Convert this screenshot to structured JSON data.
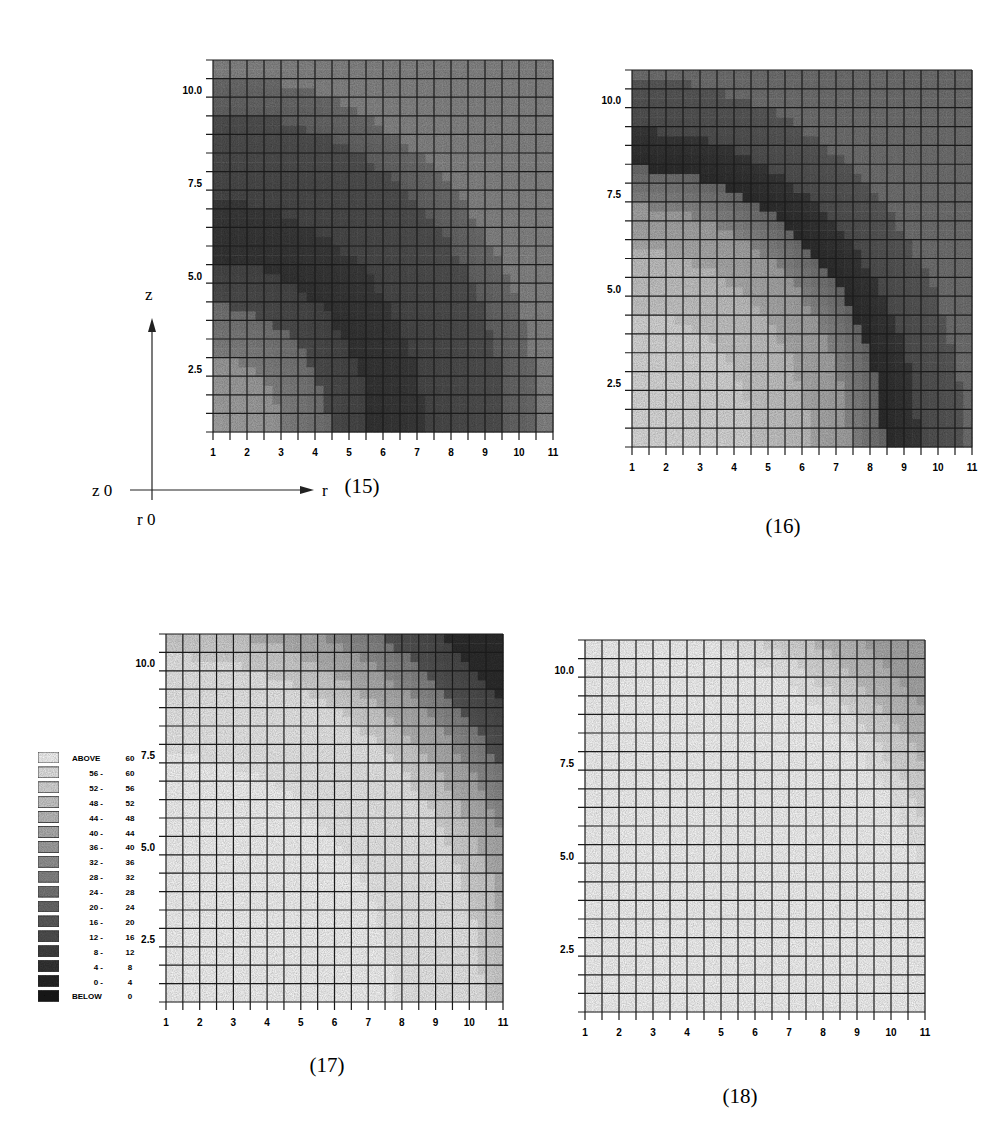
{
  "chart_data": {
    "type": "heatmap",
    "shared_axes": {
      "xlabel": "r",
      "ylabel": "z",
      "origin_labels": {
        "z": "z 0",
        "r": "r 0"
      },
      "xlim": [
        1,
        11
      ],
      "ylim": [
        0.8,
        10.8
      ],
      "x_ticks": [
        "1",
        "2",
        "3",
        "4",
        "5",
        "6",
        "7",
        "8",
        "9",
        "10",
        "11"
      ],
      "y_ticks": [
        "2.5",
        "5.0",
        "7.5",
        "10.0"
      ],
      "y_tick_values": [
        2.5,
        5.0,
        7.5,
        10.0
      ],
      "grid": true,
      "grid_divisions": {
        "r": 20,
        "z": 20
      }
    },
    "legend": {
      "placement": "left of plot (17)",
      "bands": [
        {
          "label": "ABOVE",
          "upper": "60",
          "min": 60,
          "max": null
        },
        {
          "label": "56 -",
          "upper": "60",
          "min": 56,
          "max": 60
        },
        {
          "label": "52 -",
          "upper": "56",
          "min": 52,
          "max": 56
        },
        {
          "label": "48 -",
          "upper": "52",
          "min": 48,
          "max": 52
        },
        {
          "label": "44 -",
          "upper": "48",
          "min": 44,
          "max": 48
        },
        {
          "label": "40 -",
          "upper": "44",
          "min": 40,
          "max": 44
        },
        {
          "label": "36 -",
          "upper": "40",
          "min": 36,
          "max": 40
        },
        {
          "label": "32 -",
          "upper": "36",
          "min": 32,
          "max": 36
        },
        {
          "label": "28 -",
          "upper": "32",
          "min": 28,
          "max": 32
        },
        {
          "label": "24 -",
          "upper": "28",
          "min": 24,
          "max": 28
        },
        {
          "label": "20 -",
          "upper": "24",
          "min": 20,
          "max": 24
        },
        {
          "label": "16 -",
          "upper": "20",
          "min": 16,
          "max": 20
        },
        {
          "label": "12 -",
          "upper": "16",
          "min": 12,
          "max": 16
        },
        {
          "label": "8 -",
          "upper": "12",
          "min": 8,
          "max": 12
        },
        {
          "label": "4 -",
          "upper": "8",
          "min": 4,
          "max": 8
        },
        {
          "label": "0 -",
          "upper": "4",
          "min": 0,
          "max": 4
        },
        {
          "label": "BELOW",
          "upper": "0",
          "min": null,
          "max": 0
        }
      ]
    },
    "panels": [
      {
        "id": "15",
        "caption": "(15)",
        "summary": "Mostly dark (low values 0-24); lighter wedge (28-44) near lower-left corner (r<5, z<3); darkest band runs diagonally from about (3,5) to (6,1); lighter band (32-40) at upper right near r=10-11.",
        "contour_model": {
          "center": [
            1,
            0.8
          ],
          "band_radii_in_r_units": [
            2.0,
            3.4,
            4.6,
            6.2,
            8.6,
            9.6
          ],
          "band_values": [
            40,
            30,
            14,
            6,
            12,
            20,
            30
          ]
        }
      },
      {
        "id": "16",
        "caption": "(16)",
        "summary": "Light values (44-60) in lower-left region; concentric arcs darken outward; darkest band (0-8) passes from about (2,10.8) to (9,1); moderate values (16-28) to the upper right.",
        "contour_model": {
          "center": [
            1,
            0.8
          ],
          "band_radii_in_r_units": [
            3.6,
            5.2,
            6.4,
            7.4,
            8.4,
            9.8
          ],
          "band_values": [
            56,
            50,
            42,
            32,
            4,
            14,
            24
          ]
        }
      },
      {
        "id": "17",
        "caption": "(17)",
        "summary": "Mostly above 60 (blank) over most of the domain; bands darken toward the upper-right corner, with darkest values (0-8) at r about 10-11, z about 6-10.8.",
        "contour_model": {
          "center": [
            1,
            0.8
          ],
          "band_radii_in_r_units": [
            9.4,
            10.2,
            11.0,
            11.8,
            12.8
          ],
          "band_values": [
            62,
            54,
            44,
            34,
            16,
            4
          ]
        }
      },
      {
        "id": "18",
        "caption": "(18)",
        "summary": "Nearly all above 60 (blank); light shading (44-56) only near upper-right corner at r about 9.5-11, z about 6-10.8.",
        "contour_model": {
          "center": [
            1,
            0.8
          ],
          "band_radii_in_r_units": [
            11.2,
            12.0,
            12.8
          ],
          "band_values": [
            62,
            56,
            48,
            40
          ]
        }
      }
    ]
  }
}
